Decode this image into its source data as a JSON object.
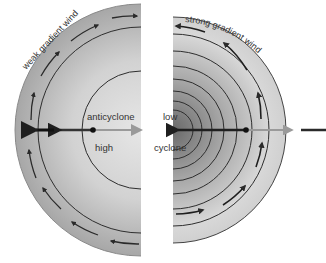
{
  "diagram": {
    "left": {
      "system": "anticyclone",
      "pressure": "high",
      "wind_label": "weak gradient wind",
      "flow": "clockwise"
    },
    "right": {
      "system": "cyclone",
      "pressure": "low",
      "wind_label": "strong gradient wind",
      "flow": "anticlockwise"
    },
    "labels": {
      "anticyclone": "anticyclone",
      "high": "high",
      "low": "low",
      "cyclone": "cyclone",
      "weak_wind": "weak gradient wind",
      "strong_wind": "strong gradient wind"
    },
    "colors": {
      "fill_outer": "#a9a9a9",
      "fill_inner": "#e4e4e4",
      "low_center": "#6e6e6e",
      "isobar": "#2e2e2e",
      "force_arrow_dark": "#1f1f1f",
      "force_arrow_light": "#9a9a9a"
    }
  }
}
